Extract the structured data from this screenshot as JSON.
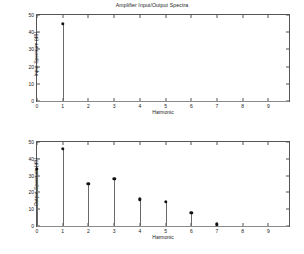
{
  "figure": {
    "title": "Amplifier Input/Output Spectra",
    "background": "#ffffff",
    "marker_color": "#111111",
    "stem_color": "#6a6a6a",
    "axis_color": "#555555"
  },
  "chart_data": [
    {
      "type": "stem",
      "title": "Amplifier Input/Output Spectra",
      "xlabel": "Harmonic",
      "ylabel": "Input Spectrum (dB)",
      "xlim": [
        0,
        9.8
      ],
      "ylim": [
        0,
        50
      ],
      "xticks": [
        0,
        1,
        2,
        3,
        4,
        5,
        6,
        7,
        8,
        9
      ],
      "xticklabels": [
        "0",
        "1",
        "2",
        "3",
        "4",
        "5",
        "6",
        "7",
        "8",
        "9"
      ],
      "yticks": [
        0,
        10,
        20,
        30,
        40,
        50
      ],
      "yticklabels": [
        "0",
        "10",
        "20",
        "30",
        "40",
        "50"
      ],
      "grid": false,
      "legend": null,
      "x": [
        1
      ],
      "values": [
        45
      ]
    },
    {
      "type": "stem",
      "title": "",
      "xlabel": "Harmonic",
      "ylabel": "Output Spectrum (dB)",
      "xlim": [
        0,
        9.8
      ],
      "ylim": [
        0,
        50
      ],
      "xticks": [
        0,
        1,
        2,
        3,
        4,
        5,
        6,
        7,
        8,
        9
      ],
      "xticklabels": [
        "0",
        "1",
        "2",
        "3",
        "4",
        "5",
        "6",
        "7",
        "8",
        "9"
      ],
      "yticks": [
        0,
        10,
        20,
        30,
        40,
        50
      ],
      "yticklabels": [
        "0",
        "10",
        "20",
        "30",
        "40",
        "50"
      ],
      "grid": false,
      "legend": null,
      "x": [
        0,
        1,
        2,
        3,
        4,
        5,
        6,
        7
      ],
      "values": [
        34,
        46,
        25,
        28,
        16,
        14.5,
        8,
        1
      ]
    }
  ]
}
